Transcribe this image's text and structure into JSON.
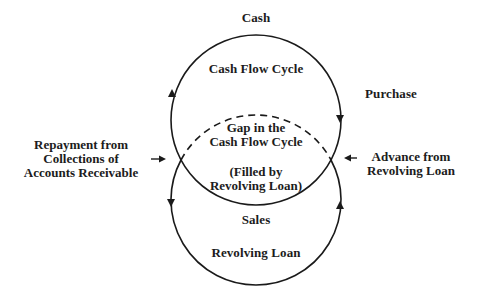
{
  "diagram": {
    "nodes": {
      "cash": "Cash",
      "cash_flow_cycle": "Cash Flow Cycle",
      "purchase": "Purchase",
      "gap_line1": "Gap in the",
      "gap_line2": "Cash Flow Cycle",
      "filled_line1": "(Filled by",
      "filled_line2": "Revolving Loan)",
      "sales": "Sales",
      "revolving_loan": "Revolving Loan"
    },
    "side_labels": {
      "repayment": [
        "Repayment from",
        "Collections of",
        "Accounts Receivable"
      ],
      "advance": [
        "Advance from",
        "Revolving Loan"
      ]
    },
    "circles": [
      {
        "name": "cash-flow-cycle",
        "cx": 256,
        "cy": 120,
        "r": 85,
        "bottom_arc": "solid"
      },
      {
        "name": "revolving-loan-cycle",
        "cx": 256,
        "cy": 200,
        "r": 85,
        "top_arc": "dashed"
      }
    ],
    "arrows": [
      {
        "name": "upper-left",
        "direction": "up"
      },
      {
        "name": "upper-right",
        "direction": "down"
      },
      {
        "name": "lower-left",
        "direction": "down"
      },
      {
        "name": "lower-right",
        "direction": "up"
      },
      {
        "name": "repayment-in",
        "direction": "right"
      },
      {
        "name": "advance-in",
        "direction": "left"
      }
    ],
    "colors": {
      "line": "#1a1a1a",
      "background": "#ffffff"
    }
  }
}
